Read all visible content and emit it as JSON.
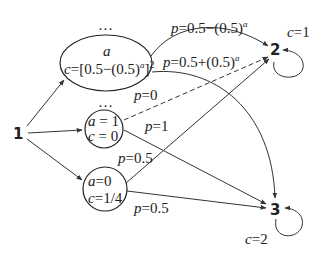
{
  "nodes": {
    "n1": {
      "label": "1"
    },
    "n2": {
      "label": "2",
      "cost_var": "c",
      "cost_eq": "=1"
    },
    "n3": {
      "label": "3",
      "cost_var": "c",
      "cost_eq": "=2"
    },
    "state_top": {
      "ellipsis": "…",
      "line1": "a",
      "line2_var": "c",
      "line2_rest": "=[0.5−(0.5)",
      "line2_sup": "a",
      "line2_close": "]",
      "line2_sup2": "2"
    },
    "state_a1": {
      "ellipsis": "…",
      "line1_var": "a",
      "line1_rest": " = 1",
      "line2_var": "c",
      "line2_rest": " = 0"
    },
    "state_a0": {
      "line1_var": "a",
      "line1_rest": "=0",
      "line2_var": "c",
      "line2_rest": "=1/4"
    }
  },
  "edges": {
    "top_to_2": {
      "var": "p",
      "rest": "=0.5−(0.5)",
      "sup": "a"
    },
    "top_to_3": {
      "var": "p",
      "rest": "=0.5+(0.5)",
      "sup": "a"
    },
    "a1_to_2": {
      "var": "p",
      "rest": "=0",
      "style": "dashed"
    },
    "a1_to_3": {
      "var": "p",
      "rest": "=1"
    },
    "a0_to_2": {
      "var": "p",
      "rest": "=0.5"
    },
    "a0_to_3": {
      "var": "p",
      "rest": "=0.5"
    }
  }
}
